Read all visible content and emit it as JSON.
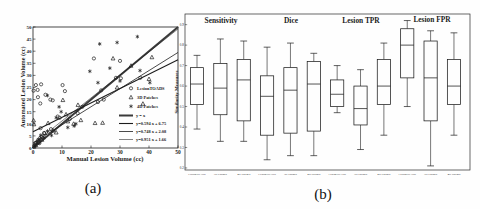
{
  "figure": {
    "caption_a": "(a)",
    "caption_b": "(b)"
  },
  "chart_data": [
    {
      "type": "scatter",
      "title": "",
      "xlabel": "Manual Lesion Volume (cc)",
      "ylabel": "Automated Lesion Volume (cc)",
      "xlim": [
        0,
        50
      ],
      "ylim": [
        0,
        50
      ],
      "xticks": [
        0,
        10,
        20,
        30,
        40,
        50
      ],
      "yticks": [
        0,
        5,
        10,
        15,
        20,
        25,
        30,
        35,
        40,
        45,
        50
      ],
      "series": [
        {
          "name": "LesionTOADS",
          "marker": "circle",
          "points": [
            [
              0.2,
              23.7
            ],
            [
              1,
              26
            ],
            [
              1.6,
              24
            ],
            [
              2.8,
              26.3
            ],
            [
              10.2,
              26
            ],
            [
              2.5,
              18.4
            ],
            [
              6.8,
              19.7
            ],
            [
              1.7,
              21
            ],
            [
              4.3,
              22
            ],
            [
              6,
              20
            ],
            [
              11,
              23.5
            ],
            [
              22.4,
              19
            ],
            [
              15.4,
              14.4
            ],
            [
              12.7,
              12
            ],
            [
              8.5,
              13
            ],
            [
              9.2,
              12.5
            ],
            [
              6.2,
              7.8
            ],
            [
              0.5,
              1
            ],
            [
              1,
              2.2
            ],
            [
              1.8,
              3.4
            ],
            [
              2.2,
              2
            ],
            [
              3,
              4.6
            ],
            [
              3.8,
              6.2
            ],
            [
              2.6,
              8.2
            ],
            [
              17,
              17
            ],
            [
              21,
              37
            ],
            [
              23.5,
              23.8
            ],
            [
              28.6,
              29
            ],
            [
              30.3,
              28.8
            ],
            [
              37,
              29
            ],
            [
              30,
              36
            ],
            [
              24.4,
              20
            ]
          ]
        },
        {
          "name": "3D Patches",
          "marker": "triangle",
          "points": [
            [
              0.2,
              11.4
            ],
            [
              0.3,
              9.8
            ],
            [
              0.4,
              0.6
            ],
            [
              1,
              1.2
            ],
            [
              1.8,
              2.3
            ],
            [
              2.3,
              4.2
            ],
            [
              3.1,
              3.4
            ],
            [
              4,
              6.2
            ],
            [
              5.2,
              10.3
            ],
            [
              7,
              7.2
            ],
            [
              8,
              6.4
            ],
            [
              10.3,
              19.8
            ],
            [
              11.4,
              13.9
            ],
            [
              12,
              11
            ],
            [
              14,
              10
            ],
            [
              15.5,
              17.8
            ],
            [
              16.5,
              11.5
            ],
            [
              21.4,
              10.3
            ],
            [
              24,
              10.4
            ],
            [
              27.6,
              37
            ],
            [
              33.8,
              34
            ],
            [
              29,
              25
            ],
            [
              37.9,
              18.3
            ],
            [
              41,
              37.5
            ],
            [
              40,
              28.5
            ]
          ]
        },
        {
          "name": "4D Patches",
          "marker": "asterisk",
          "points": [
            [
              0.6,
              1.2
            ],
            [
              1.3,
              2.4
            ],
            [
              2.1,
              3.2
            ],
            [
              2.7,
              5.3
            ],
            [
              3.8,
              4.2
            ],
            [
              5,
              21.7
            ],
            [
              5,
              7
            ],
            [
              6.4,
              5.2
            ],
            [
              9,
              17
            ],
            [
              9.7,
              15
            ],
            [
              14.2,
              9.1
            ],
            [
              14.8,
              10
            ],
            [
              19.6,
              31.7
            ],
            [
              22.4,
              27
            ],
            [
              23,
              43
            ],
            [
              26.5,
              33
            ],
            [
              29,
              43.6
            ],
            [
              30,
              27.7
            ],
            [
              36,
              46
            ],
            [
              36.9,
              32
            ],
            [
              40.3,
              27
            ],
            [
              12,
              8.5
            ],
            [
              8,
              12.5
            ]
          ]
        }
      ],
      "fit_lines": [
        {
          "label": "y = x",
          "slope": 1,
          "intercept": 0,
          "stroke_width": 2
        },
        {
          "label": "y=0.594 x + 6.75",
          "slope": 0.594,
          "intercept": 6.75,
          "stroke_width": 1.1
        },
        {
          "label": "y=0.748 x + 2.08",
          "slope": 0.748,
          "intercept": 2.08,
          "stroke_width": 0.8
        },
        {
          "label": "y=0.951 x + 1.66",
          "slope": 0.951,
          "intercept": 1.66,
          "stroke_width": 0.55
        }
      ]
    },
    {
      "type": "boxplot",
      "ylabel": "Similarity Measures",
      "ylim": [
        0.19,
        0.952
      ],
      "yticks": [
        0.2,
        0.3,
        0.4,
        0.5,
        0.6,
        0.7,
        0.8,
        0.9
      ],
      "methods": [
        "LesionTOADS",
        "3D Patches",
        "4D Patches"
      ],
      "groups": [
        {
          "label": "Sensitivity",
          "boxes": [
            {
              "method": "LesionTOADS",
              "whislo": 0.39,
              "q1": 0.51,
              "med": 0.61,
              "q3": 0.69,
              "whishi": 0.75
            },
            {
              "method": "3D Patches",
              "whislo": 0.33,
              "q1": 0.46,
              "med": 0.59,
              "q3": 0.71,
              "whishi": 0.83
            },
            {
              "method": "4D Patches",
              "whislo": 0.33,
              "q1": 0.43,
              "med": 0.63,
              "q3": 0.73,
              "whishi": 0.82
            }
          ]
        },
        {
          "label": "Dice",
          "boxes": [
            {
              "method": "LesionTOADS",
              "whislo": 0.24,
              "q1": 0.36,
              "med": 0.55,
              "q3": 0.65,
              "whishi": 0.79
            },
            {
              "method": "3D Patches",
              "whislo": 0.26,
              "q1": 0.37,
              "med": 0.58,
              "q3": 0.69,
              "whishi": 0.81
            },
            {
              "method": "4D Patches",
              "whislo": 0.26,
              "q1": 0.38,
              "med": 0.61,
              "q3": 0.72,
              "whishi": 0.76
            }
          ]
        },
        {
          "label": "Lesion TPR",
          "boxes": [
            {
              "method": "LesionTOADS",
              "whislo": 0.47,
              "q1": 0.5,
              "med": 0.56,
              "q3": 0.63,
              "whishi": 0.7
            },
            {
              "method": "3D Patches",
              "whislo": 0.29,
              "q1": 0.41,
              "med": 0.49,
              "q3": 0.6,
              "whishi": 0.68
            },
            {
              "method": "4D Patches",
              "whislo": 0.36,
              "q1": 0.51,
              "med": 0.6,
              "q3": 0.73,
              "whishi": 0.81
            }
          ]
        },
        {
          "label": "Lesion FPR",
          "boxes": [
            {
              "method": "LesionTOADS",
              "whislo": 0.5,
              "q1": 0.64,
              "med": 0.8,
              "q3": 0.88,
              "whishi": 0.92
            },
            {
              "method": "3D Patches",
              "whislo": 0.21,
              "q1": 0.43,
              "med": 0.64,
              "q3": 0.82,
              "whishi": 0.87
            },
            {
              "method": "4D Patches",
              "whislo": 0.36,
              "q1": 0.51,
              "med": 0.6,
              "q3": 0.73,
              "whishi": 0.86
            }
          ]
        }
      ]
    }
  ],
  "colors": {
    "ink": "#1c1c1c",
    "paper": "#fefefe"
  }
}
